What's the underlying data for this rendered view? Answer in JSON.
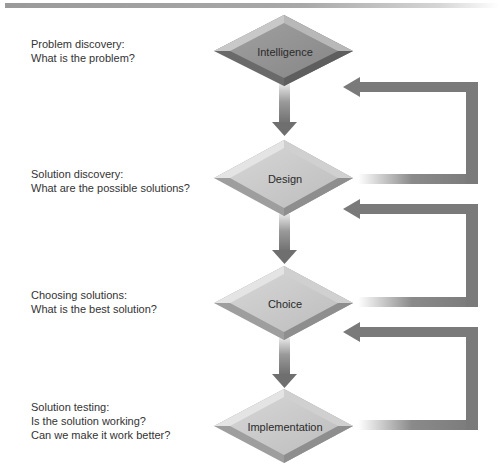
{
  "diagram": {
    "title_bar": "",
    "stages": [
      {
        "id": "intelligence",
        "label": "Intelligence",
        "cx": 284,
        "cy": 51,
        "description": [
          "Problem discovery:",
          "What is the problem?"
        ],
        "label_top": 37,
        "face": "#909090"
      },
      {
        "id": "design",
        "label": "Design",
        "cx": 284,
        "cy": 178,
        "description": [
          "Solution discovery:",
          "What are the possible solutions?"
        ],
        "label_top": 167,
        "face": "#c4c4c4"
      },
      {
        "id": "choice",
        "label": "Choice",
        "cx": 284,
        "cy": 303,
        "description": [
          "Choosing solutions:",
          "What is the best solution?"
        ],
        "label_top": 288,
        "face": "#c4c4c4"
      },
      {
        "id": "implementation",
        "label": "Implementation",
        "cx": 284,
        "cy": 426,
        "description": [
          "Solution testing:",
          "Is the solution working?",
          "Can we make it work better?"
        ],
        "label_top": 400,
        "face": "#c4c4c4"
      }
    ],
    "flow_arrows": [
      {
        "from": "intelligence",
        "to": "design",
        "direction": "down"
      },
      {
        "from": "design",
        "to": "choice",
        "direction": "down"
      },
      {
        "from": "choice",
        "to": "implementation",
        "direction": "down"
      }
    ],
    "feedback_loops": [
      {
        "from": "design",
        "to": "intelligence"
      },
      {
        "from": "choice",
        "to": "design"
      },
      {
        "from": "implementation",
        "to": "choice"
      }
    ],
    "colors": {
      "arrow": "#7a7a7a",
      "text": "#333333",
      "top_bar": "#9a9a9a"
    }
  }
}
